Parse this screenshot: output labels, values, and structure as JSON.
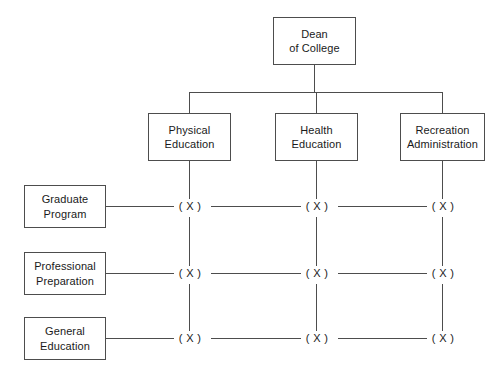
{
  "diagram": {
    "type": "matrix-organizational-chart",
    "title": "",
    "background_color": "#ffffff",
    "line_color": "#4d4d4d",
    "text_color": "#1a1a1a",
    "root": {
      "id": "dean",
      "label": "Dean\nof College"
    },
    "columns": [
      {
        "id": "physical-education",
        "label": "Physical\nEducation"
      },
      {
        "id": "health-education",
        "label": "Health\nEducation"
      },
      {
        "id": "recreation-administration",
        "label": "Recreation\nAdministration"
      }
    ],
    "rows": [
      {
        "id": "graduate-program",
        "label": "Graduate\nProgram"
      },
      {
        "id": "professional-preparation",
        "label": "Professional\nPreparation"
      },
      {
        "id": "general-education",
        "label": "General\nEducation"
      }
    ],
    "cell_marker": "( X )",
    "cells": [
      {
        "row": "graduate-program",
        "col": "physical-education",
        "marker": "( X )"
      },
      {
        "row": "graduate-program",
        "col": "health-education",
        "marker": "( X )"
      },
      {
        "row": "graduate-program",
        "col": "recreation-administration",
        "marker": "( X )"
      },
      {
        "row": "professional-preparation",
        "col": "physical-education",
        "marker": "( X )"
      },
      {
        "row": "professional-preparation",
        "col": "health-education",
        "marker": "( X )"
      },
      {
        "row": "professional-preparation",
        "col": "recreation-administration",
        "marker": "( X )"
      },
      {
        "row": "general-education",
        "col": "physical-education",
        "marker": "( X )"
      },
      {
        "row": "general-education",
        "col": "health-education",
        "marker": "( X )"
      },
      {
        "row": "general-education",
        "col": "recreation-administration",
        "marker": "( X )"
      }
    ]
  }
}
